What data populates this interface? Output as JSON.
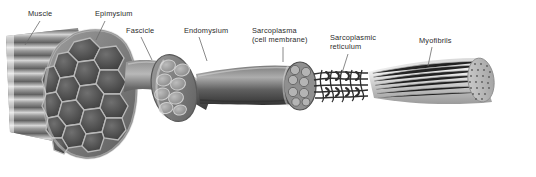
{
  "figure": {
    "style": "greyscale anatomical illustration",
    "background_color": "#ffffff",
    "label_color": "#2b2b2b",
    "leader_line_color": "#6b6b6b",
    "width": 536,
    "height": 177
  },
  "labels": [
    {
      "id": "muscle",
      "text": "Muscle",
      "x": 28,
      "y": 9,
      "leader": {
        "x1": 40,
        "y1": 21,
        "x2": 25,
        "y2": 45
      }
    },
    {
      "id": "epimysium",
      "text": "Epimysium",
      "x": 95,
      "y": 9,
      "leader": {
        "x1": 105,
        "y1": 21,
        "x2": 96,
        "y2": 40
      }
    },
    {
      "id": "fascicle",
      "text": "Fascicle",
      "x": 126,
      "y": 26,
      "leader": {
        "x1": 141,
        "y1": 37,
        "x2": 152,
        "y2": 60
      }
    },
    {
      "id": "endomysium",
      "text": "Endomysium",
      "x": 184,
      "y": 26,
      "leader": {
        "x1": 199,
        "y1": 37,
        "x2": 207,
        "y2": 61
      }
    },
    {
      "id": "sarcoplasma",
      "text": "Sarcoplasma\n(cell membrane)",
      "x": 252,
      "y": 26,
      "leader": {
        "x1": 283,
        "y1": 47,
        "x2": 283,
        "y2": 62
      }
    },
    {
      "id": "sarcoplasmic-reticulum",
      "text": "Sarcoplasmic\nreticulum",
      "x": 330,
      "y": 33,
      "leader": {
        "x1": 348,
        "y1": 54,
        "x2": 342,
        "y2": 73
      }
    },
    {
      "id": "myofibrils",
      "text": "Myofibrils",
      "x": 419,
      "y": 36,
      "leader": {
        "x1": 432,
        "y1": 47,
        "x2": 428,
        "y2": 66
      }
    }
  ],
  "structures": [
    {
      "id": "muscle-belly",
      "name": "Muscle belly with striated fibers"
    },
    {
      "id": "epimysium-cross-section",
      "name": "Epimysium cross-section with fascicle honeycomb"
    },
    {
      "id": "fascicle-tube",
      "name": "Fascicle tube"
    },
    {
      "id": "fascicle-cross-section",
      "name": "Fascicle cross-section with muscle fibers"
    },
    {
      "id": "muscle-fiber-tube",
      "name": "Muscle fiber tube"
    },
    {
      "id": "muscle-fiber-cross-section",
      "name": "Muscle fiber cross-section with myofibrils"
    },
    {
      "id": "sarcoplasmic-reticulum-network",
      "name": "Sarcoplasmic reticulum tubule network"
    },
    {
      "id": "myofibril-cylinder",
      "name": "Myofibril cylinder with striations and dotted end face"
    }
  ]
}
